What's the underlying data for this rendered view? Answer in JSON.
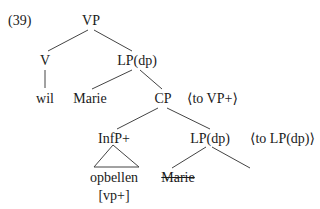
{
  "example_number": "(39)",
  "tree": {
    "root": "VP",
    "v": "V",
    "v_word": "wil",
    "lp_top": "LP(dp)",
    "spec_lp_top": "Marie",
    "cp": "CP",
    "cp_annotation": "⟨to VP+⟩",
    "infp": "InfP+",
    "infp_word": "opbellen",
    "infp_feature": "[vp+]",
    "lp_lower": "LP(dp)",
    "lp_lower_annotation": "⟨to LP(dp)⟩",
    "struck_spec": "Marie"
  }
}
